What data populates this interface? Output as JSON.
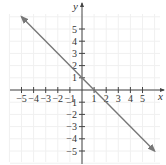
{
  "chart_data": {
    "type": "line",
    "title": "",
    "xlabel": "x",
    "ylabel": "y",
    "xlim": [
      -6,
      6
    ],
    "ylim": [
      -6,
      6
    ],
    "grid": true,
    "x_ticks": [
      -5,
      -4,
      -3,
      -2,
      -1,
      1,
      2,
      3,
      4,
      5
    ],
    "y_ticks": [
      5,
      4,
      3,
      2,
      1,
      -1,
      -2,
      -3,
      -4,
      -5
    ],
    "x_tick_labels": [
      "−5",
      "−4",
      "−3",
      "−2",
      "−1",
      "1",
      "2",
      "3",
      "4",
      "5"
    ],
    "y_tick_labels": [
      "5",
      "4",
      "3",
      "2",
      "1",
      "−1",
      "−2",
      "−3",
      "−4",
      "−5"
    ],
    "series": [
      {
        "name": "y = -x + 1",
        "equation": "y = -x + 1",
        "x": [
          -5,
          6
        ],
        "y": [
          6,
          -5
        ],
        "arrows": "both",
        "color": "#777777"
      }
    ],
    "axis_color": "#444444",
    "grid_color": "#f0f0f0"
  }
}
